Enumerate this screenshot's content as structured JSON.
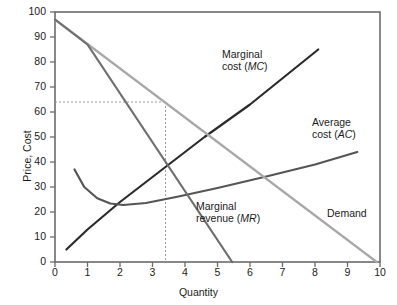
{
  "chart_data": {
    "type": "line",
    "title": "",
    "xlabel": "Quantity",
    "ylabel": "Price, Cost",
    "xlim": [
      0,
      10
    ],
    "ylim": [
      0,
      100
    ],
    "xticks": [
      0,
      1,
      2,
      3,
      4,
      5,
      6,
      7,
      8,
      9,
      10
    ],
    "yticks": [
      0,
      10,
      20,
      30,
      40,
      50,
      60,
      70,
      80,
      90,
      100
    ],
    "grid": false,
    "legend": "inline-annotations",
    "series": [
      {
        "name": "Marginal cost (MC)",
        "label_html": "Marginal\ncost (MC)",
        "color": "#2b2b2b",
        "width": 2.2,
        "points": [
          [
            0.35,
            5
          ],
          [
            1.0,
            13
          ],
          [
            2.0,
            24
          ],
          [
            3.4,
            38
          ],
          [
            4.6,
            50
          ],
          [
            6.0,
            63
          ],
          [
            8.1,
            85
          ]
        ],
        "label_x": 222,
        "label_y": 48
      },
      {
        "name": "Average cost (AC)",
        "label_html": "Average\ncost (AC)",
        "color": "#555555",
        "width": 2.2,
        "points": [
          [
            0.6,
            37
          ],
          [
            0.9,
            30
          ],
          [
            1.3,
            25.5
          ],
          [
            1.7,
            23.4
          ],
          [
            2.1,
            22.8
          ],
          [
            2.8,
            23.6
          ],
          [
            3.8,
            26.2
          ],
          [
            5.0,
            29.6
          ],
          [
            6.5,
            34.2
          ],
          [
            8.0,
            39.0
          ],
          [
            9.3,
            44
          ]
        ],
        "label_x": 312,
        "label_y": 116
      },
      {
        "name": "Demand",
        "label_html": "Demand",
        "color": "#a8a8a8",
        "width": 2.2,
        "points": [
          [
            0,
            97
          ],
          [
            9.9,
            0
          ]
        ],
        "label_x": 327,
        "label_y": 207
      },
      {
        "name": "Marginal revenue (MR)",
        "label_html": "Marginal\nrevenue (MR)",
        "color": "#6e6e6e",
        "width": 2.2,
        "points": [
          [
            0,
            97
          ],
          [
            1.0,
            87
          ],
          [
            5.45,
            0
          ]
        ],
        "label_x": 196,
        "label_y": 200
      }
    ],
    "guides": {
      "price": 64,
      "quantity": 3.4,
      "color": "#9a9a9a",
      "style": "dotted"
    },
    "axis_color": "#6b6b6b",
    "frame_color": "#6b6b6b"
  },
  "labels": {
    "mc_line1": "Marginal",
    "mc_line2": "cost (",
    "mc_ital": "MC",
    "mc_line2b": ")",
    "ac_line1": "Average",
    "ac_line2": "cost (",
    "ac_ital": "AC",
    "ac_line2b": ")",
    "mr_line1": "Marginal",
    "mr_line2": "revenue (",
    "mr_ital": "MR",
    "mr_line2b": ")",
    "demand": "Demand",
    "xaxis": "Quantity",
    "yaxis": "Price, Cost"
  }
}
